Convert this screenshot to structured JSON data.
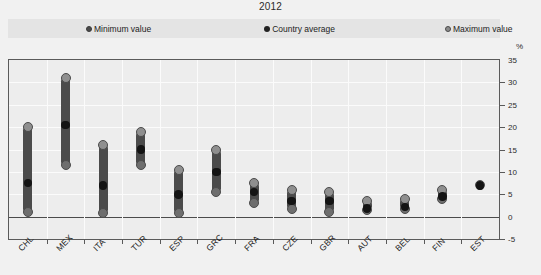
{
  "title": "2012",
  "unit_label": "%",
  "legend": {
    "items": [
      {
        "label": "Minimum value",
        "key": "min",
        "color": "#4a4a4a"
      },
      {
        "label": "Country average",
        "key": "avg",
        "color": "#222222"
      },
      {
        "label": "Maximum value",
        "key": "max",
        "color": "#8b8b8b"
      }
    ]
  },
  "axis": {
    "y": {
      "ticks": [
        "35",
        "30",
        "25",
        "20",
        "15",
        "10",
        "5",
        "0",
        "-5"
      ],
      "values": [
        35,
        30,
        25,
        20,
        15,
        10,
        5,
        0,
        -5
      ],
      "min": -5,
      "max": 35,
      "step": 5
    }
  },
  "chart_data": {
    "type": "scatter",
    "title": "2012",
    "xlabel": "",
    "ylabel": "%",
    "ylim": [
      -5,
      35
    ],
    "grid": true,
    "legend_position": "top",
    "categories": [
      "CHL",
      "MEX",
      "ITA",
      "TUR",
      "ESP",
      "GRC",
      "FRA",
      "CZE",
      "GBR",
      "AUT",
      "BEL",
      "FIN",
      "EST"
    ],
    "series": [
      {
        "name": "Minimum value",
        "values": [
          1.0,
          11.5,
          0.7,
          11.5,
          0.7,
          5.5,
          3.0,
          1.7,
          1.0,
          1.5,
          1.8,
          4.0,
          7.0
        ]
      },
      {
        "name": "Country average",
        "values": [
          7.5,
          20.5,
          7.0,
          15.0,
          5.0,
          10.0,
          5.5,
          3.5,
          3.5,
          1.8,
          2.2,
          4.5,
          7.0
        ]
      },
      {
        "name": "Maximum value",
        "values": [
          20.0,
          31.0,
          16.0,
          19.0,
          10.5,
          15.0,
          7.5,
          6.0,
          5.5,
          3.5,
          4.0,
          6.0,
          7.0
        ]
      }
    ]
  }
}
